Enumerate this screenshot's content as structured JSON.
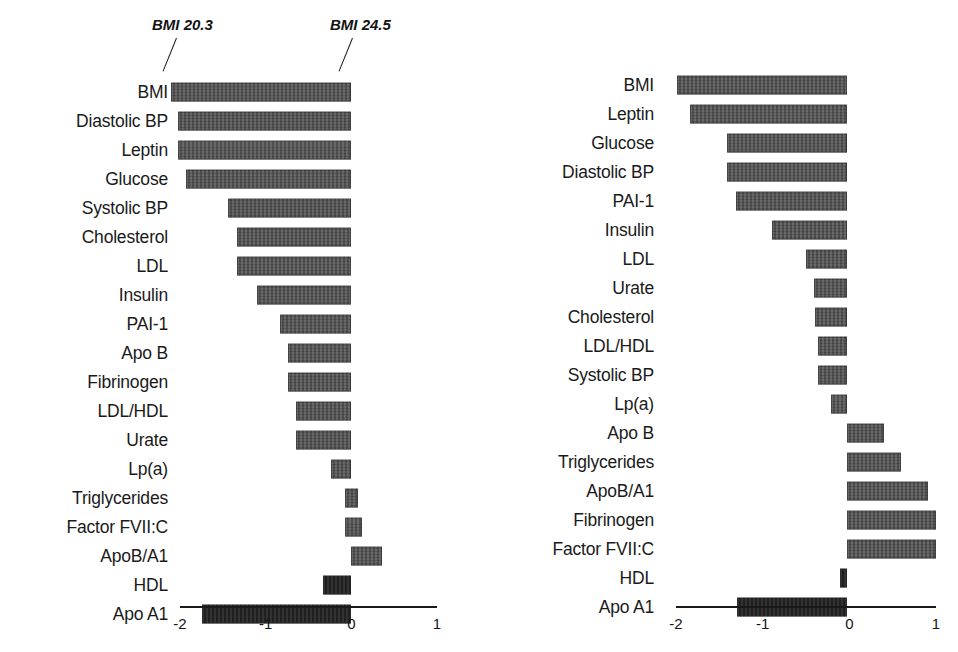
{
  "chart_data": [
    {
      "id": "left",
      "type": "bar",
      "orientation": "horizontal",
      "title": "",
      "xlabel": "",
      "ylabel": "",
      "xlim": [
        -2,
        1
      ],
      "xticks": [
        -2,
        -1,
        0,
        1
      ],
      "xticklabels": [
        "-2",
        "-1",
        "0",
        "1"
      ],
      "grid": false,
      "legend": null,
      "annotations": [
        {
          "text": "BMI 20.3",
          "points_to": "left end of BMI bar"
        },
        {
          "text": "BMI 24.5",
          "points_to": "right end of BMI bar"
        }
      ],
      "categories": [
        "BMI",
        "Diastolic BP",
        "Leptin",
        "Glucose",
        "Systolic BP",
        "Cholesterol",
        "LDL",
        "Insulin",
        "PAI-1",
        "Apo B",
        "Fibrinogen",
        "LDL/HDL",
        "Urate",
        "Lp(a)",
        "Triglycerides",
        "Factor FVII:C",
        "ApoB/A1",
        "HDL",
        "Apo A1"
      ],
      "values": [
        -2.1,
        -2.02,
        -2.02,
        -1.92,
        -1.44,
        -1.33,
        -1.33,
        -1.1,
        -0.83,
        -0.74,
        -0.74,
        -0.64,
        -0.64,
        -0.23,
        0.08,
        0.13,
        0.36,
        -0.33,
        -1.74
      ],
      "bar_starts": [
        -2.1,
        -2.02,
        -2.02,
        -1.92,
        -1.44,
        -1.33,
        -1.33,
        -1.1,
        -0.83,
        -0.74,
        -0.74,
        -0.64,
        -0.64,
        -0.23,
        -0.07,
        -0.07,
        0.0,
        -0.33,
        -1.74
      ],
      "bar_ends": [
        0.0,
        0.0,
        0.0,
        0.0,
        0.0,
        0.0,
        0.0,
        0.0,
        0.0,
        0.0,
        0.0,
        0.0,
        0.0,
        0.0,
        0.08,
        0.13,
        0.36,
        0.0,
        0.0
      ],
      "highlight_rows": [
        "Apo A1",
        "HDL"
      ]
    },
    {
      "id": "right",
      "type": "bar",
      "orientation": "horizontal",
      "title": "",
      "xlabel": "",
      "ylabel": "",
      "xlim": [
        -2,
        1
      ],
      "xticks": [
        -2,
        -1,
        0,
        1
      ],
      "xticklabels": [
        "-2",
        "-1",
        "0",
        "1"
      ],
      "grid": false,
      "legend": null,
      "annotations": [],
      "categories": [
        "BMI",
        "Leptin",
        "Glucose",
        "Diastolic BP",
        "PAI-1",
        "Insulin",
        "LDL",
        "Urate",
        "Cholesterol",
        "LDL/HDL",
        "Systolic BP",
        "Lp(a)",
        "Apo B",
        "Triglycerides",
        "ApoB/A1",
        "Fibrinogen",
        "Factor FVII:C",
        "HDL",
        "Apo A1"
      ],
      "values": [
        -1.96,
        -1.81,
        -1.38,
        -1.38,
        -1.28,
        -0.87,
        -0.47,
        -0.38,
        -0.37,
        -0.34,
        -0.34,
        -0.18,
        0.43,
        0.62,
        0.93,
        1.03,
        1.03,
        -0.08,
        -1.27
      ],
      "bar_starts": [
        -1.96,
        -1.81,
        -1.38,
        -1.38,
        -1.28,
        -0.87,
        -0.47,
        -0.38,
        -0.37,
        -0.34,
        -0.34,
        -0.18,
        0.0,
        0.0,
        0.0,
        0.0,
        0.0,
        -0.08,
        -1.27
      ],
      "bar_ends": [
        0.0,
        0.0,
        0.0,
        0.0,
        0.0,
        0.0,
        0.0,
        0.0,
        0.0,
        0.0,
        0.0,
        0.0,
        0.43,
        0.62,
        0.93,
        1.03,
        1.03,
        0.0,
        0.0
      ],
      "highlight_rows": [
        "Apo A1",
        "HDL"
      ]
    }
  ],
  "layout": {
    "left_panel": {
      "row_top": 77,
      "row_pitch": 29,
      "axis_y": 606,
      "axis_x0": 180,
      "axis_x1": 437,
      "unit_px": 85.7,
      "zero_x": 351,
      "tick_label_y": 612
    },
    "right_panel": {
      "row_top": 70,
      "row_pitch": 29,
      "axis_y": 606,
      "axis_x0": 197,
      "axis_x1": 457,
      "unit_px": 86.7,
      "zero_x": 368,
      "tick_label_y": 612
    },
    "annotation_left": {
      "x": 152,
      "y": 22,
      "leader_x": 176,
      "leader_y": 38,
      "leader_len": 36
    },
    "annotation_right": {
      "x": 330,
      "y": 22,
      "leader_x": 353,
      "leader_y": 38,
      "leader_len": 36
    }
  },
  "colors": {
    "bar": "#4d4d4d",
    "bar_dark": "#232323",
    "axis": "#1a1a1a",
    "text": "#141414",
    "background": "#ffffff"
  }
}
